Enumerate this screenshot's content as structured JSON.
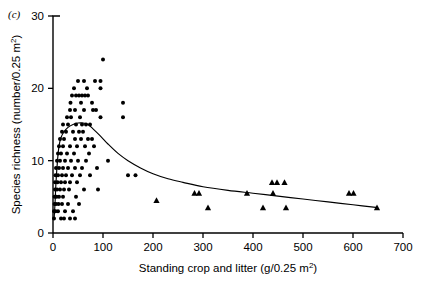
{
  "figure": {
    "panel_label": "(c)"
  },
  "chart_data": {
    "type": "scatter",
    "title": "",
    "xlabel": "Standing crop and litter (g/0.25 m",
    "xlabel_sup": "2",
    "xlabel_tail": ")",
    "ylabel": "Species richness (number/0.25 m",
    "ylabel_sup": "2",
    "ylabel_tail": ")",
    "xlim": [
      0,
      700
    ],
    "ylim": [
      0,
      30
    ],
    "xticks": [
      0,
      100,
      200,
      300,
      400,
      500,
      600,
      700
    ],
    "xtick_labels": [
      "0",
      "100",
      "200",
      "300",
      "400",
      "500",
      "600",
      "700"
    ],
    "yticks": [
      0,
      10,
      20,
      30
    ],
    "ytick_labels": [
      "0",
      "10",
      "20",
      "30"
    ],
    "grid": false,
    "legend": "none",
    "series": [
      {
        "name": "circle-points",
        "marker": "circle",
        "color": "#000000",
        "points": [
          [
            100,
            24
          ],
          [
            50,
            21
          ],
          [
            62,
            21
          ],
          [
            84,
            21
          ],
          [
            95,
            21
          ],
          [
            42,
            20
          ],
          [
            68,
            20
          ],
          [
            95,
            20
          ],
          [
            38,
            19
          ],
          [
            46,
            19
          ],
          [
            52,
            19
          ],
          [
            58,
            19
          ],
          [
            64,
            19
          ],
          [
            70,
            19
          ],
          [
            35,
            18
          ],
          [
            56,
            18
          ],
          [
            78,
            18
          ],
          [
            140,
            18
          ],
          [
            34,
            17
          ],
          [
            44,
            17
          ],
          [
            62,
            17
          ],
          [
            80,
            17
          ],
          [
            86,
            17
          ],
          [
            140,
            16
          ],
          [
            28,
            16
          ],
          [
            36,
            16
          ],
          [
            54,
            16
          ],
          [
            95,
            16
          ],
          [
            20,
            15
          ],
          [
            30,
            15
          ],
          [
            46,
            15
          ],
          [
            58,
            15
          ],
          [
            66,
            15
          ],
          [
            74,
            15
          ],
          [
            18,
            14
          ],
          [
            26,
            14
          ],
          [
            40,
            14
          ],
          [
            52,
            14
          ],
          [
            60,
            14
          ],
          [
            14,
            13
          ],
          [
            22,
            13
          ],
          [
            44,
            13
          ],
          [
            56,
            13
          ],
          [
            70,
            13
          ],
          [
            78,
            13
          ],
          [
            12,
            12
          ],
          [
            20,
            12
          ],
          [
            34,
            12
          ],
          [
            48,
            12
          ],
          [
            64,
            12
          ],
          [
            82,
            12
          ],
          [
            10,
            11
          ],
          [
            16,
            11
          ],
          [
            28,
            11
          ],
          [
            42,
            11
          ],
          [
            72,
            11
          ],
          [
            8,
            10
          ],
          [
            14,
            10
          ],
          [
            24,
            10
          ],
          [
            36,
            10
          ],
          [
            50,
            10
          ],
          [
            66,
            10
          ],
          [
            110,
            10
          ],
          [
            6,
            9
          ],
          [
            12,
            9
          ],
          [
            20,
            9
          ],
          [
            30,
            9
          ],
          [
            44,
            9
          ],
          [
            58,
            9
          ],
          [
            88,
            9
          ],
          [
            150,
            8
          ],
          [
            165,
            8
          ],
          [
            5,
            8
          ],
          [
            10,
            8
          ],
          [
            18,
            8
          ],
          [
            26,
            8
          ],
          [
            38,
            8
          ],
          [
            54,
            8
          ],
          [
            74,
            8
          ],
          [
            4,
            7
          ],
          [
            9,
            7
          ],
          [
            16,
            7
          ],
          [
            24,
            7
          ],
          [
            34,
            7
          ],
          [
            48,
            7
          ],
          [
            4,
            6
          ],
          [
            8,
            6
          ],
          [
            14,
            6
          ],
          [
            22,
            6
          ],
          [
            32,
            6
          ],
          [
            62,
            6
          ],
          [
            90,
            6
          ],
          [
            3,
            5
          ],
          [
            7,
            5
          ],
          [
            12,
            5
          ],
          [
            20,
            5
          ],
          [
            46,
            5
          ],
          [
            3,
            4
          ],
          [
            6,
            4
          ],
          [
            11,
            4
          ],
          [
            18,
            4
          ],
          [
            30,
            4
          ],
          [
            52,
            4
          ],
          [
            2,
            3
          ],
          [
            5,
            3
          ],
          [
            10,
            3
          ],
          [
            24,
            3
          ],
          [
            40,
            3
          ],
          [
            2,
            2
          ],
          [
            16,
            2
          ],
          [
            22,
            2
          ],
          [
            34,
            2
          ],
          [
            44,
            2
          ]
        ]
      },
      {
        "name": "triangle-points",
        "marker": "triangle",
        "color": "#000000",
        "points": [
          [
            207,
            4.5
          ],
          [
            283,
            5.5
          ],
          [
            292,
            5.5
          ],
          [
            310,
            3.5
          ],
          [
            388,
            5.5
          ],
          [
            420,
            3.5
          ],
          [
            438,
            7.0
          ],
          [
            448,
            7.0
          ],
          [
            440,
            5.5
          ],
          [
            463,
            7.0
          ],
          [
            466,
            3.5
          ],
          [
            592,
            5.5
          ],
          [
            601,
            5.5
          ],
          [
            648,
            3.5
          ]
        ]
      }
    ],
    "fitted_curve": {
      "name": "fitted-curve",
      "color": "#000000",
      "points": [
        [
          2,
          1.8
        ],
        [
          4,
          4.0
        ],
        [
          6,
          7.0
        ],
        [
          9,
          10.0
        ],
        [
          12,
          12.0
        ],
        [
          16,
          13.2
        ],
        [
          22,
          14.0
        ],
        [
          30,
          14.6
        ],
        [
          40,
          15.0
        ],
        [
          50,
          15.2
        ],
        [
          60,
          15.2
        ],
        [
          70,
          15.0
        ],
        [
          80,
          14.4
        ],
        [
          95,
          13.4
        ],
        [
          110,
          12.3
        ],
        [
          130,
          11.0
        ],
        [
          150,
          10.0
        ],
        [
          175,
          9.0
        ],
        [
          200,
          8.2
        ],
        [
          230,
          7.5
        ],
        [
          260,
          7.0
        ],
        [
          300,
          6.4
        ],
        [
          350,
          5.9
        ],
        [
          400,
          5.5
        ],
        [
          450,
          5.1
        ],
        [
          500,
          4.7
        ],
        [
          550,
          4.3
        ],
        [
          600,
          3.9
        ],
        [
          650,
          3.5
        ]
      ]
    }
  }
}
